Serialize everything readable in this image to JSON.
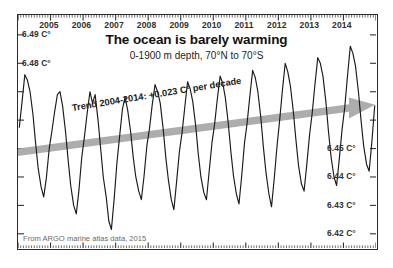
{
  "chart_data": {
    "type": "line",
    "title": "The ocean is barely warming",
    "subtitle": "0-1900 m depth, 70°N to 70°S",
    "xlabel": "",
    "ylabel": "",
    "grid": false,
    "legend": null,
    "source": "From ARGO marine atlas data, 2015",
    "annotations": [
      {
        "name": "trend-annotation",
        "text": "Trend 2004-2014: +0.023 C° per decade",
        "kind": "trend-arrow-label"
      }
    ],
    "trend_arrow": {
      "label": "Trend 2004-2014: +0.023 C° per decade",
      "slope_per_decade": 0.023,
      "units": "C°",
      "start_year": 2004,
      "end_year": 2014,
      "color": "#a9a9a9"
    },
    "xlim": [
      2004.0,
      2015.0
    ],
    "xticks": [
      2005,
      2006,
      2007,
      2008,
      2009,
      2010,
      2011,
      2012,
      2013,
      2014
    ],
    "xticklabels": [
      "2005",
      "2006",
      "2007",
      "2008",
      "2009",
      "2010",
      "2011",
      "2012",
      "2013",
      "2014"
    ],
    "ylim": [
      6.415,
      6.497
    ],
    "yticks_left": [
      6.49,
      6.48
    ],
    "yticklabels_left": [
      "6.49 C°",
      "6.48 C°"
    ],
    "yticks_right": [
      6.45,
      6.44,
      6.43,
      6.42
    ],
    "yticklabels_right": [
      "6.45 C°",
      "6.44 C°",
      "6.43 C°",
      "6.42 C°"
    ],
    "series": [
      {
        "name": "Global ocean temperature 0-1900 m",
        "color": "#1a1a1a",
        "x": [
          2004.04,
          2004.12,
          2004.21,
          2004.29,
          2004.37,
          2004.46,
          2004.54,
          2004.62,
          2004.71,
          2004.79,
          2004.87,
          2004.96,
          2005.04,
          2005.12,
          2005.21,
          2005.29,
          2005.37,
          2005.46,
          2005.54,
          2005.62,
          2005.71,
          2005.79,
          2005.87,
          2005.96,
          2006.04,
          2006.12,
          2006.21,
          2006.29,
          2006.37,
          2006.46,
          2006.54,
          2006.62,
          2006.71,
          2006.79,
          2006.87,
          2006.96,
          2007.04,
          2007.12,
          2007.21,
          2007.29,
          2007.37,
          2007.46,
          2007.54,
          2007.62,
          2007.71,
          2007.79,
          2007.87,
          2007.96,
          2008.04,
          2008.12,
          2008.21,
          2008.29,
          2008.37,
          2008.46,
          2008.54,
          2008.62,
          2008.71,
          2008.79,
          2008.87,
          2008.96,
          2009.04,
          2009.12,
          2009.21,
          2009.29,
          2009.37,
          2009.46,
          2009.54,
          2009.62,
          2009.71,
          2009.79,
          2009.87,
          2009.96,
          2010.04,
          2010.12,
          2010.21,
          2010.29,
          2010.37,
          2010.46,
          2010.54,
          2010.62,
          2010.71,
          2010.79,
          2010.87,
          2010.96,
          2011.04,
          2011.12,
          2011.21,
          2011.29,
          2011.37,
          2011.46,
          2011.54,
          2011.62,
          2011.71,
          2011.79,
          2011.87,
          2011.96,
          2012.04,
          2012.12,
          2012.21,
          2012.29,
          2012.37,
          2012.46,
          2012.54,
          2012.62,
          2012.71,
          2012.79,
          2012.87,
          2012.96,
          2013.04,
          2013.12,
          2013.21,
          2013.29,
          2013.37,
          2013.46,
          2013.54,
          2013.62,
          2013.71,
          2013.79,
          2013.87,
          2013.96,
          2014.04,
          2014.12,
          2014.21,
          2014.29,
          2014.37,
          2014.46,
          2014.54,
          2014.62,
          2014.71,
          2014.79,
          2014.87,
          2014.96
        ],
        "y": [
          6.4575,
          6.466,
          6.476,
          6.474,
          6.47,
          6.462,
          6.452,
          6.443,
          6.4365,
          6.433,
          6.4395,
          6.45,
          6.456,
          6.4625,
          6.469,
          6.47,
          6.465,
          6.456,
          6.446,
          6.437,
          6.43,
          6.427,
          6.435,
          6.447,
          6.454,
          6.462,
          6.47,
          6.466,
          6.469,
          6.46,
          6.45,
          6.44,
          6.433,
          6.4245,
          6.4215,
          6.433,
          6.445,
          6.454,
          6.464,
          6.468,
          6.4635,
          6.456,
          6.447,
          6.44,
          6.435,
          6.432,
          6.44,
          6.451,
          6.457,
          6.465,
          6.4725,
          6.47,
          6.466,
          6.457,
          6.447,
          6.439,
          6.432,
          6.4285,
          6.438,
          6.449,
          6.4555,
          6.464,
          6.4735,
          6.471,
          6.4665,
          6.458,
          6.448,
          6.44,
          6.4345,
          6.432,
          6.4415,
          6.452,
          6.4585,
          6.467,
          6.4755,
          6.473,
          6.468,
          6.459,
          6.449,
          6.4405,
          6.434,
          6.4305,
          6.44,
          6.452,
          6.459,
          6.468,
          6.4775,
          6.475,
          6.47,
          6.461,
          6.4505,
          6.4415,
          6.434,
          6.4295,
          6.439,
          6.451,
          6.46,
          6.47,
          6.48,
          6.477,
          6.472,
          6.463,
          6.453,
          6.444,
          6.4375,
          6.435,
          6.444,
          6.455,
          6.4625,
          6.472,
          6.482,
          6.48,
          6.4755,
          6.4665,
          6.456,
          6.447,
          6.44,
          6.437,
          6.446,
          6.457,
          6.4645,
          6.475,
          6.486,
          6.4835,
          6.479,
          6.47,
          6.46,
          6.451,
          6.4445,
          6.442,
          6.452,
          6.465
        ]
      }
    ]
  }
}
